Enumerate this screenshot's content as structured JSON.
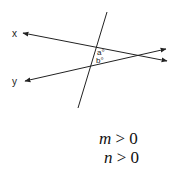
{
  "diagram": {
    "lines": {
      "x": {
        "label": "x"
      },
      "y": {
        "label": "y"
      },
      "transversal": {}
    },
    "angles": {
      "a": "a°",
      "b": "b°"
    },
    "colors": {
      "stroke": "#222222"
    }
  },
  "conditions": {
    "first": {
      "var": "m",
      "rel": " > 0"
    },
    "second": {
      "var": "n",
      "rel": " > 0"
    }
  }
}
